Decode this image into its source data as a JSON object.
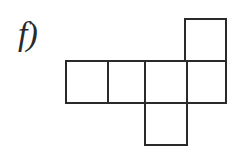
{
  "figure": {
    "label": "f)",
    "label_icon": "script-f-parenthesis-glyph",
    "caption": "",
    "background_color": "#ffffff",
    "stroke_color": "#2a2a2a",
    "fill_color": "#ffffff",
    "stroke_width": 2,
    "shape_name": "cube-net-hexomino",
    "cell_size": 42,
    "canvas": {
      "width": 237,
      "height": 155
    },
    "cells": [
      {
        "name": "row-square-1",
        "x": 66,
        "y": 61,
        "w": 42,
        "h": 42
      },
      {
        "name": "row-square-2",
        "x": 108,
        "y": 61,
        "w": 42,
        "h": 42
      },
      {
        "name": "row-square-3",
        "x": 145,
        "y": 61,
        "w": 42,
        "h": 42
      },
      {
        "name": "row-square-4",
        "x": 187,
        "y": 61,
        "w": 39,
        "h": 42
      },
      {
        "name": "top-square",
        "x": 185,
        "y": 19,
        "w": 41,
        "h": 42
      },
      {
        "name": "bottom-square",
        "x": 145,
        "y": 103,
        "w": 42,
        "h": 42
      }
    ]
  }
}
